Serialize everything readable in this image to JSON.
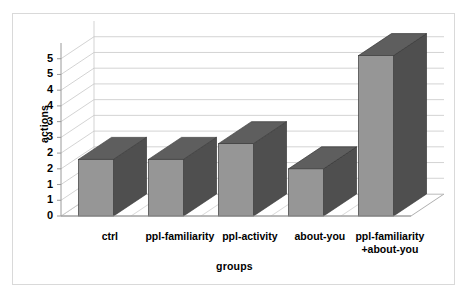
{
  "chart_data": {
    "type": "bar",
    "title": "",
    "subtitle": "",
    "xlabel": "groups",
    "ylabel": "actions",
    "categories": [
      "ctrl",
      "ppl-familiarity",
      "ppl-activity",
      "about-you",
      "ppl-familiarity\n+about-you"
    ],
    "values": [
      1.8,
      1.8,
      2.3,
      1.5,
      5.1
    ],
    "ylim": [
      0,
      5.5
    ],
    "ytick_values": [
      0,
      0.5,
      1,
      1.5,
      2,
      2.5,
      3,
      3.5,
      4,
      4.5,
      5
    ],
    "ytick_labels": [
      "0",
      "1",
      "1",
      "2",
      "2",
      "3",
      "3",
      "4",
      "4",
      "5",
      "5"
    ],
    "grid": true,
    "legend": false,
    "legend_position": "none",
    "style": "3d-column",
    "series": [
      {
        "name": "actions",
        "values": [
          1.8,
          1.8,
          2.3,
          1.5,
          5.1
        ]
      }
    ]
  },
  "colors": {
    "bar_front": "#969696",
    "bar_top": "#5e5e5e",
    "bar_side": "#4f4f4f",
    "bar_outline": "#3a3a3a",
    "gridline": "#c8c8c8",
    "axis_line": "#9a9a9a",
    "floor": "#ffffff",
    "back_wall": "#ffffff",
    "frame_border": "#d9d9d9",
    "background": "#ffffff",
    "text": "#000000"
  }
}
